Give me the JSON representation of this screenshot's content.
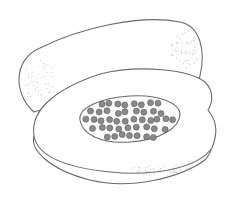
{
  "image": {
    "subject": "papaya illustration",
    "description": "Line drawing of a whole papaya behind a halved papaya showing seeds",
    "colors": {
      "background": "#ffffff",
      "outline": "#6b6b6b",
      "seed": "#8a8a8a",
      "stipple": "#9a9a9a"
    },
    "elements": [
      "whole-papaya",
      "halved-papaya",
      "seed-cavity",
      "seeds",
      "stippling"
    ]
  }
}
